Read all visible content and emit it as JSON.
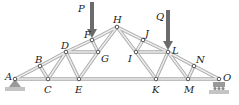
{
  "diagram": {
    "type": "truss",
    "colors": {
      "member_edge": "#a9a9a9",
      "member_fill": "#ececec",
      "load_arrow": "#6b6b6b",
      "support": "#9a9a9a",
      "label": "#222222"
    },
    "joints": [
      {
        "id": "A",
        "x": 15,
        "y": 79,
        "lx": 5,
        "ly": 80
      },
      {
        "id": "B",
        "x": 40,
        "y": 66,
        "lx": 35,
        "ly": 63
      },
      {
        "id": "C",
        "x": 48,
        "y": 79,
        "lx": 44,
        "ly": 93
      },
      {
        "id": "D",
        "x": 66,
        "y": 52,
        "lx": 61,
        "ly": 49
      },
      {
        "id": "E",
        "x": 79,
        "y": 79,
        "lx": 75,
        "ly": 93
      },
      {
        "id": "F",
        "x": 92,
        "y": 40,
        "lx": 84,
        "ly": 38
      },
      {
        "id": "G",
        "x": 98,
        "y": 52,
        "lx": 101,
        "ly": 62
      },
      {
        "id": "H",
        "x": 117,
        "y": 27,
        "lx": 113,
        "ly": 23
      },
      {
        "id": "I",
        "x": 136,
        "y": 52,
        "lx": 128,
        "ly": 62
      },
      {
        "id": "J",
        "x": 143,
        "y": 40,
        "lx": 145,
        "ly": 37
      },
      {
        "id": "K",
        "x": 156,
        "y": 79,
        "lx": 152,
        "ly": 93
      },
      {
        "id": "L",
        "x": 168,
        "y": 52,
        "lx": 172,
        "ly": 54
      },
      {
        "id": "M",
        "x": 188,
        "y": 79,
        "lx": 184,
        "ly": 93
      },
      {
        "id": "N",
        "x": 194,
        "y": 66,
        "lx": 196,
        "ly": 63
      },
      {
        "id": "O",
        "x": 219,
        "y": 79,
        "lx": 223,
        "ly": 81
      }
    ],
    "members": [
      [
        "A",
        "B"
      ],
      [
        "B",
        "D"
      ],
      [
        "D",
        "F"
      ],
      [
        "F",
        "H"
      ],
      [
        "H",
        "J"
      ],
      [
        "J",
        "L"
      ],
      [
        "L",
        "N"
      ],
      [
        "N",
        "O"
      ],
      [
        "A",
        "C"
      ],
      [
        "C",
        "E"
      ],
      [
        "E",
        "K"
      ],
      [
        "K",
        "M"
      ],
      [
        "M",
        "O"
      ],
      [
        "B",
        "C"
      ],
      [
        "C",
        "D"
      ],
      [
        "D",
        "E"
      ],
      [
        "D",
        "G"
      ],
      [
        "F",
        "G"
      ],
      [
        "E",
        "G"
      ],
      [
        "G",
        "H"
      ],
      [
        "H",
        "I"
      ],
      [
        "I",
        "J"
      ],
      [
        "I",
        "K"
      ],
      [
        "I",
        "L"
      ],
      [
        "K",
        "L"
      ],
      [
        "L",
        "M"
      ],
      [
        "M",
        "N"
      ]
    ],
    "loads": [
      {
        "label": "P",
        "joint": "F",
        "x": 92,
        "y_top": 2,
        "y_tip": 38,
        "lx": 78,
        "ly": 12
      },
      {
        "label": "Q",
        "joint": "L",
        "x": 168,
        "y_top": 10,
        "y_tip": 50,
        "lx": 156,
        "ly": 20
      }
    ],
    "supports": [
      {
        "joint": "A",
        "kind": "pin"
      },
      {
        "joint": "O",
        "kind": "roller"
      }
    ]
  }
}
